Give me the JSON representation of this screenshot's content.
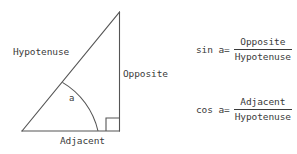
{
  "figure": {
    "kind": "right-triangle-trigonometry-diagram",
    "background_color": "#ffffff",
    "stroke_color": "#555555",
    "text_color": "#3a3a3a"
  },
  "triangle": {
    "labels": {
      "hypotenuse": "Hypotenuse",
      "opposite": "Opposite",
      "adjacent": "Adjacent",
      "angle": "a"
    },
    "geometry": {
      "left_vertex": [
        22,
        131
      ],
      "right_vertex": [
        119,
        131
      ],
      "apex": [
        119,
        12
      ],
      "right_angle_marker": [
        106,
        118,
        13,
        13
      ],
      "angle_arc_radius": 76
    }
  },
  "formulas": [
    {
      "name": "sine",
      "lhs": "sin a=",
      "numerator": "Opposite",
      "denominator": "Hypotenuse"
    },
    {
      "name": "cosine",
      "lhs": "cos a=",
      "numerator": "Adjacent",
      "denominator": "Hypotenuse"
    }
  ]
}
